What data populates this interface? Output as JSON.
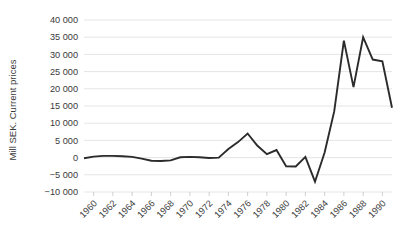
{
  "chart_data": {
    "type": "line",
    "title": "",
    "xlabel": "",
    "ylabel": "Mill SEK. Current prices",
    "ylim": [
      -10000,
      40000
    ],
    "ytick_step": 5000,
    "ytick_labels": [
      "40 000",
      "35 000",
      "30 000",
      "25 000",
      "20 000",
      "15 000",
      "10 000",
      "5 000",
      "0",
      "−5 000",
      "−10 000"
    ],
    "ytick_values": [
      40000,
      35000,
      30000,
      25000,
      20000,
      15000,
      10000,
      5000,
      0,
      -5000,
      -10000
    ],
    "xtick_labels": [
      "1960",
      "1962",
      "1964",
      "1966",
      "1968",
      "1970",
      "1972",
      "1974",
      "1976",
      "1978",
      "1980",
      "1982",
      "1984",
      "1986",
      "1988",
      "1990"
    ],
    "xtick_values": [
      1960,
      1962,
      1964,
      1966,
      1968,
      1970,
      1972,
      1974,
      1976,
      1978,
      1980,
      1982,
      1984,
      1986,
      1988,
      1990
    ],
    "xlim": [
      1959,
      1991
    ],
    "grid": "horizontal",
    "legend": "none",
    "line_color": "#2b2b2b",
    "grid_color": "#e2e2e2",
    "x": [
      1959,
      1960,
      1961,
      1962,
      1963,
      1964,
      1965,
      1966,
      1967,
      1968,
      1969,
      1970,
      1971,
      1972,
      1973,
      1974,
      1975,
      1976,
      1977,
      1978,
      1979,
      1980,
      1981,
      1982,
      1983,
      1984,
      1985,
      1986,
      1987,
      1988,
      1989,
      1990,
      1991
    ],
    "series": [
      {
        "name": "Mill SEK. Current prices",
        "values": [
          -200,
          300,
          500,
          500,
          400,
          200,
          -300,
          -900,
          -1000,
          -800,
          100,
          200,
          100,
          -100,
          0,
          2500,
          4500,
          7000,
          3500,
          1000,
          2200,
          -2500,
          -2600,
          200,
          -7000,
          1500,
          13500,
          34000,
          20500,
          35000,
          28500,
          28000,
          14500
        ]
      }
    ]
  }
}
